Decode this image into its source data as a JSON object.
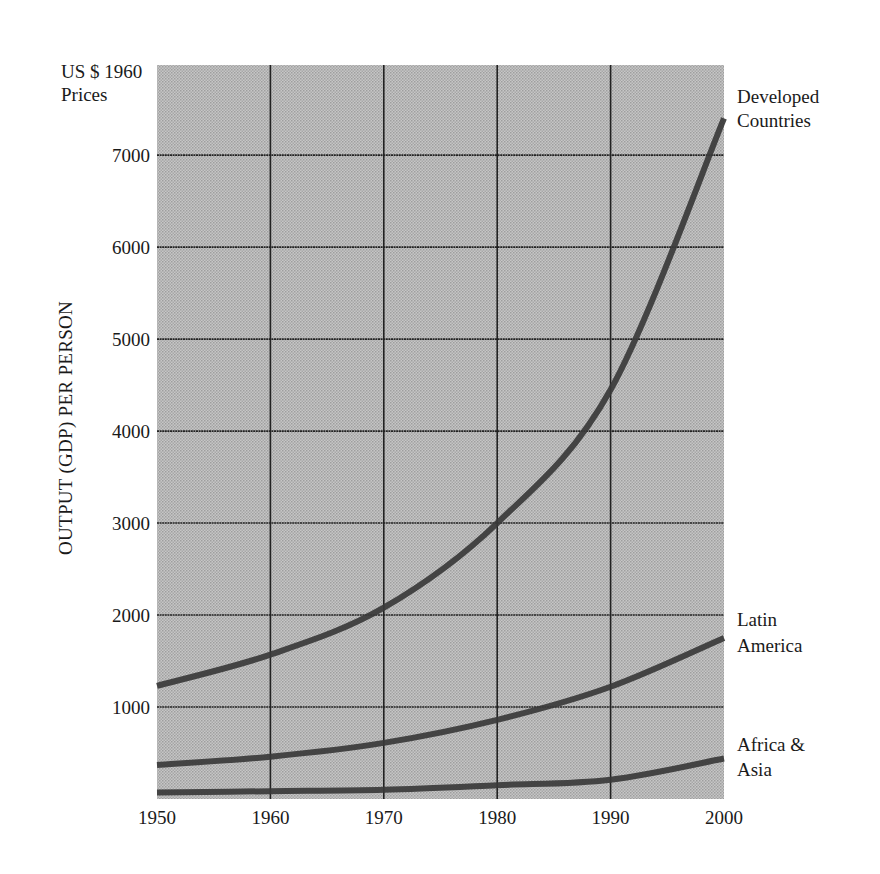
{
  "chart_data": {
    "type": "line",
    "title": "",
    "xlabel": "",
    "ylabel": "OUTPUT (GDP) PER PERSON",
    "yunit_label": [
      "US $ 1960",
      "Prices"
    ],
    "x": [
      1950,
      1960,
      1970,
      1980,
      1990,
      2000
    ],
    "x_ticks": [
      "1950",
      "1960",
      "1970",
      "1980",
      "1990",
      "2000"
    ],
    "y_ticks": [
      "1000",
      "2000",
      "3000",
      "4000",
      "5000",
      "6000",
      "7000"
    ],
    "xlim": [
      1950,
      2000
    ],
    "ylim": [
      0,
      7980
    ],
    "grid": true,
    "legend_position": "inline-right",
    "series": [
      {
        "name": "Developed Countries",
        "label_lines": [
          "Developed",
          "Countries"
        ],
        "values": [
          1230,
          1570,
          2080,
          3000,
          4450,
          7400
        ]
      },
      {
        "name": "Latin America",
        "label_lines": [
          "Latin",
          "America"
        ],
        "values": [
          370,
          460,
          610,
          860,
          1220,
          1750
        ]
      },
      {
        "name": "Africa & Asia",
        "label_lines": [
          "Africa &",
          "Asia"
        ],
        "values": [
          70,
          85,
          100,
          150,
          210,
          440
        ]
      }
    ]
  },
  "colors": {
    "plot_background": "#b9b9b9",
    "line": "#3a3a3a",
    "grid": "#222222",
    "text": "#1a1a1a"
  }
}
